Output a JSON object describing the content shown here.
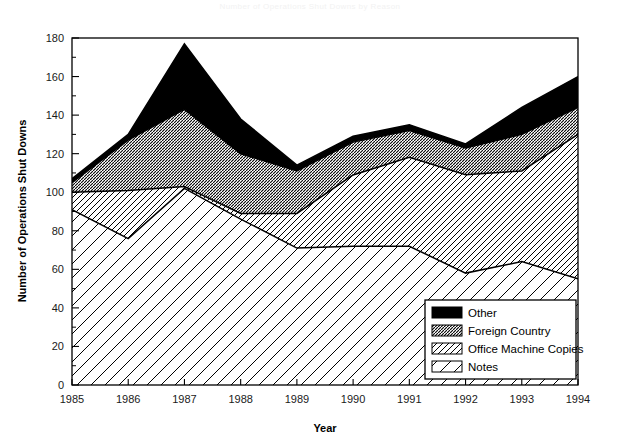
{
  "faint_title": "Number of Operations Shut Downs by Reason",
  "axes": {
    "y_title": "Number of Operations Shut Downs",
    "x_title": "Year",
    "y_ticks": [
      0,
      20,
      40,
      60,
      80,
      100,
      120,
      140,
      160,
      180
    ],
    "y_minor_step": 10,
    "y_lim": [
      0,
      180
    ],
    "x_ticks": [
      "1985",
      "1986",
      "1987",
      "1988",
      "1989",
      "1990",
      "1991",
      "1992",
      "1993",
      "1994"
    ],
    "x_lim": [
      1985,
      1994
    ]
  },
  "legend": {
    "position": "bottom-right-inside",
    "items": [
      {
        "label": "Other",
        "pattern": "solid-black",
        "color": "#000000"
      },
      {
        "label": "Foreign Country",
        "pattern": "dense-hatch",
        "color": "#000000"
      },
      {
        "label": "Office Machine Copies",
        "pattern": "medium-diagonal",
        "color": "#000000"
      },
      {
        "label": "Notes",
        "pattern": "sparse-diagonal",
        "color": "#000000"
      }
    ]
  },
  "chart_data": {
    "type": "area",
    "stacked": true,
    "title": "Number of Operations Shut Downs by Reason",
    "xlabel": "Year",
    "ylabel": "Number of Operations Shut Downs",
    "xlim": [
      1985,
      1994
    ],
    "ylim": [
      0,
      180
    ],
    "grid": false,
    "legend_position": "lower right",
    "x": [
      1985,
      1986,
      1987,
      1988,
      1989,
      1990,
      1991,
      1992,
      1993,
      1994
    ],
    "categories": [
      "1985",
      "1986",
      "1987",
      "1988",
      "1989",
      "1990",
      "1991",
      "1992",
      "1993",
      "1994"
    ],
    "series": [
      {
        "name": "Notes",
        "values": [
          91,
          76,
          102,
          86,
          71,
          72,
          72,
          58,
          64,
          55
        ]
      },
      {
        "name": "Office Machine Copies",
        "values": [
          9,
          25,
          1,
          3,
          18,
          37,
          46,
          51,
          47,
          75
        ]
      },
      {
        "name": "Foreign Country",
        "values": [
          5,
          26,
          40,
          31,
          22,
          17,
          14,
          14,
          19,
          14
        ]
      },
      {
        "name": "Other",
        "values": [
          2,
          3,
          34,
          18,
          3,
          3,
          3,
          2,
          14,
          16
        ]
      }
    ],
    "cumulative_boundaries": {
      "notes": [
        91,
        76,
        102,
        86,
        71,
        72,
        72,
        58,
        64,
        55
      ],
      "plus_office_machine": [
        100,
        101,
        103,
        89,
        89,
        109,
        118,
        109,
        111,
        130
      ],
      "plus_foreign_country": [
        105,
        127,
        143,
        120,
        111,
        126,
        132,
        123,
        130,
        144
      ],
      "total": [
        107,
        130,
        177,
        138,
        114,
        129,
        135,
        125,
        144,
        160
      ]
    },
    "totals_by_year": [
      107,
      130,
      177,
      138,
      114,
      129,
      135,
      125,
      144,
      160
    ]
  }
}
